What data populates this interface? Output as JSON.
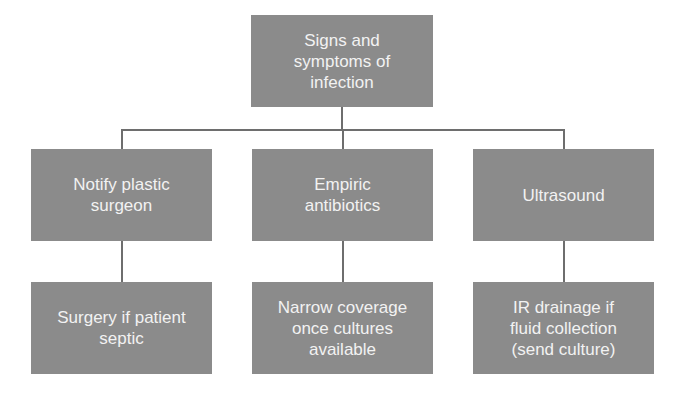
{
  "diagram": {
    "root": {
      "label": "Signs and symptoms of infection"
    },
    "branches": [
      {
        "label": "Notify plastic surgeon",
        "child": {
          "label": "Surgery if patient septic"
        }
      },
      {
        "label": "Empiric antibiotics",
        "child": {
          "label": "Narrow coverage once cultures available"
        }
      },
      {
        "label": "Ultrasound",
        "child": {
          "label": "IR drainage if fluid collection (send culture)"
        }
      }
    ]
  },
  "colors": {
    "box_fill": "#8b8b8b",
    "box_text": "#f2f2f2",
    "connector": "#6e6e6e",
    "background": "#ffffff"
  }
}
